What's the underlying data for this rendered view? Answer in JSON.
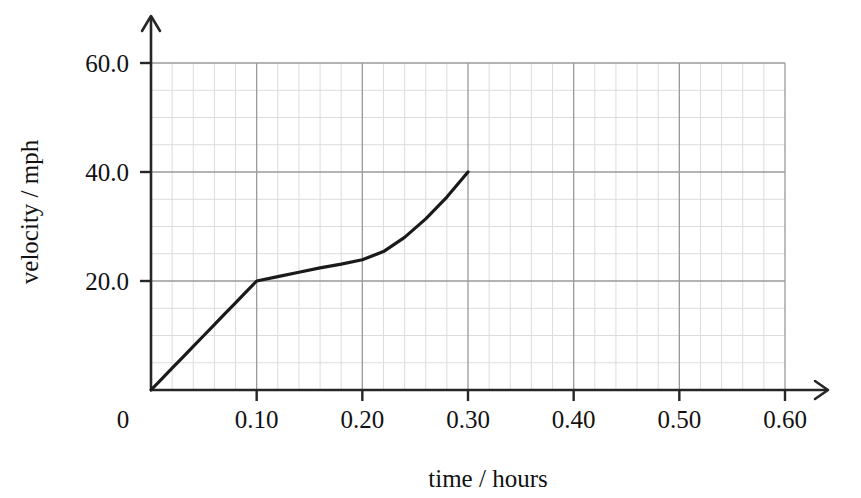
{
  "chart_data": {
    "type": "line",
    "title": "",
    "xlabel": "time / hours",
    "ylabel": "velocity / mph",
    "xlim": [
      0,
      0.6
    ],
    "ylim": [
      0,
      65
    ],
    "grid": true,
    "minor_grid": true,
    "legend": "none",
    "x_ticks": [
      {
        "value": 0,
        "label": "0"
      },
      {
        "value": 0.1,
        "label": "0.10"
      },
      {
        "value": 0.2,
        "label": "0.20"
      },
      {
        "value": 0.3,
        "label": "0.30"
      },
      {
        "value": 0.4,
        "label": "0.40"
      },
      {
        "value": 0.5,
        "label": "0.50"
      },
      {
        "value": 0.6,
        "label": "0.60"
      }
    ],
    "y_ticks": [
      {
        "value": 20,
        "label": "20.0"
      },
      {
        "value": 40,
        "label": "40.0"
      },
      {
        "value": 60,
        "label": "60.0"
      }
    ],
    "x_minor_per_major": 5,
    "y_minor_per_major": 4,
    "series": [
      {
        "name": "velocity",
        "x": [
          0.0,
          0.01,
          0.02,
          0.03,
          0.04,
          0.05,
          0.06,
          0.07,
          0.08,
          0.09,
          0.1,
          0.12,
          0.14,
          0.16,
          0.18,
          0.2,
          0.22,
          0.24,
          0.26,
          0.28,
          0.3
        ],
        "values": [
          0.0,
          2.0,
          4.0,
          6.0,
          8.0,
          10.0,
          12.0,
          14.0,
          16.0,
          18.0,
          20.0,
          20.8,
          21.6,
          22.4,
          23.1,
          23.9,
          25.4,
          28.0,
          31.4,
          35.4,
          40.0
        ],
        "color": "#1a1a1a",
        "width": 3.2
      }
    ],
    "annotations": [
      {
        "label": "origin",
        "x": 0.0,
        "y": 0.0
      },
      {
        "label": "kink",
        "x": 0.1,
        "y": 20.0
      },
      {
        "label": "end",
        "x": 0.3,
        "y": 40.0
      }
    ],
    "colors": {
      "curve": "#1a1a1a",
      "axis": "#262626",
      "major_grid": "#9a9a9a",
      "minor_grid": "#dcdcdc",
      "text": "#111111",
      "background": "#ffffff"
    }
  }
}
